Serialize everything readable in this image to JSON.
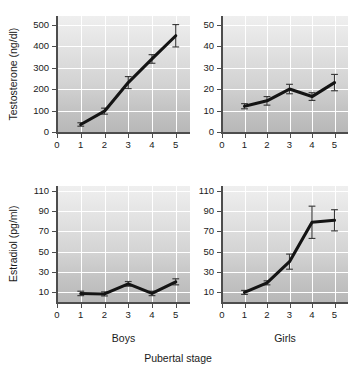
{
  "figure": {
    "xaxis_title": "Pubertal stage",
    "group_labels": {
      "boys": "Boys",
      "girls": "Girls"
    }
  },
  "chart_data": [
    {
      "id": "testosterone-boys",
      "type": "line",
      "title": "",
      "xlabel": "Boys",
      "ylabel": "Testosterone (ng/dl)",
      "xlim": [
        0,
        5.6
      ],
      "ylim": [
        0,
        540
      ],
      "xticks": [
        0,
        1,
        2,
        3,
        4,
        5
      ],
      "xticklabels": [
        "0",
        "1",
        "2",
        "3",
        "4",
        "5"
      ],
      "yticks": [
        0,
        100,
        200,
        300,
        400,
        500
      ],
      "yticklabels": [
        "0",
        "100",
        "200",
        "300",
        "400",
        "500"
      ],
      "grid": true,
      "legend": "none",
      "x": [
        1,
        2,
        3,
        4,
        5
      ],
      "values": [
        35,
        97,
        230,
        340,
        448
      ],
      "errors": [
        8,
        14,
        28,
        20,
        52
      ]
    },
    {
      "id": "testosterone-girls",
      "type": "line",
      "title": "",
      "xlabel": "Girls",
      "ylabel": "Testosterone (ng/dl)",
      "xlim": [
        0,
        5.6
      ],
      "ylim": [
        0,
        54
      ],
      "xticks": [
        0,
        1,
        2,
        3,
        4,
        5
      ],
      "xticklabels": [
        "0",
        "1",
        "2",
        "3",
        "4",
        "5"
      ],
      "yticks": [
        0,
        10,
        20,
        30,
        40,
        50
      ],
      "yticklabels": [
        "0",
        "10",
        "20",
        "30",
        "40",
        "50"
      ],
      "grid": true,
      "legend": "none",
      "x": [
        1,
        2,
        3,
        4,
        5
      ],
      "values": [
        12,
        14.5,
        20,
        16.5,
        23
      ],
      "errors": [
        1.2,
        2.0,
        2.2,
        1.8,
        3.8
      ]
    },
    {
      "id": "estradiol-boys",
      "type": "line",
      "title": "",
      "xlabel": "Boys",
      "ylabel": "Estradiol (pg/ml)",
      "xlim": [
        0,
        5.6
      ],
      "ylim": [
        0,
        115
      ],
      "xticks": [
        0,
        1,
        2,
        3,
        4,
        5
      ],
      "xticklabels": [
        "0",
        "1",
        "2",
        "3",
        "4",
        "5"
      ],
      "yticks": [
        10,
        30,
        50,
        70,
        90,
        110
      ],
      "yticklabels": [
        "10",
        "30",
        "50",
        "70",
        "90",
        "110"
      ],
      "grid": true,
      "legend": "none",
      "x": [
        1,
        2,
        3,
        4,
        5
      ],
      "values": [
        8.5,
        8,
        18,
        8.5,
        20
      ],
      "errors": [
        2.2,
        2.0,
        2.3,
        2.2,
        3.0
      ]
    },
    {
      "id": "estradiol-girls",
      "type": "line",
      "title": "",
      "xlabel": "Girls",
      "ylabel": "Estradiol (pg/ml)",
      "xlim": [
        0,
        5.6
      ],
      "ylim": [
        0,
        115
      ],
      "xticks": [
        0,
        1,
        2,
        3,
        4,
        5
      ],
      "xticklabels": [
        "0",
        "1",
        "2",
        "3",
        "4",
        "5"
      ],
      "yticks": [
        10,
        30,
        50,
        70,
        90,
        110
      ],
      "yticklabels": [
        "10",
        "30",
        "50",
        "70",
        "90",
        "110"
      ],
      "grid": true,
      "legend": "none",
      "x": [
        1,
        2,
        3,
        4,
        5
      ],
      "values": [
        9.5,
        19,
        40,
        79,
        81
      ],
      "errors": [
        2.0,
        2.0,
        7.5,
        16.0,
        10.5
      ]
    }
  ],
  "style": {
    "line_color": "#141414",
    "error_color": "#3a3a3a",
    "grid_color": "#ffffff",
    "axis_color": "#4d4d4d",
    "text_color": "#1a1a1a"
  }
}
